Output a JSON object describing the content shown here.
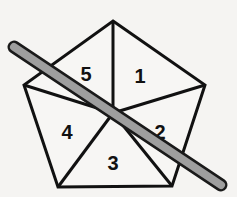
{
  "figure": {
    "name": "pentagon-with-stick",
    "background_color": "#f5f4f2",
    "canvas": {
      "width": 237,
      "height": 197
    },
    "pentagon": {
      "stroke_color": "#111111",
      "fill_color": "#f7f6f4",
      "stroke_width": 3,
      "vertices": [
        {
          "name": "top",
          "x": 113,
          "y": 21
        },
        {
          "name": "right",
          "x": 205,
          "y": 85
        },
        {
          "name": "bottom-right",
          "x": 172,
          "y": 186
        },
        {
          "name": "bottom-left",
          "x": 58,
          "y": 187
        },
        {
          "name": "left",
          "x": 24,
          "y": 85
        }
      ],
      "points_attr": "113,21 205,85 172,186 58,187 24,85",
      "center": {
        "x": 113,
        "y": 113
      }
    },
    "spokes": [
      {
        "name": "spoke-to-top",
        "x1": 113,
        "y1": 113,
        "x2": 113,
        "y2": 21
      },
      {
        "name": "spoke-to-right",
        "x1": 113,
        "y1": 113,
        "x2": 205,
        "y2": 85
      },
      {
        "name": "spoke-to-bottom-right",
        "x1": 113,
        "y1": 113,
        "x2": 172,
        "y2": 186
      },
      {
        "name": "spoke-to-bottom-left",
        "x1": 113,
        "y1": 113,
        "x2": 58,
        "y2": 187
      },
      {
        "name": "spoke-to-left",
        "x1": 113,
        "y1": 113,
        "x2": 24,
        "y2": 85
      }
    ],
    "sectors": [
      {
        "id": "sector-1",
        "label": "1",
        "x": 140,
        "y": 78
      },
      {
        "id": "sector-2",
        "label": "2",
        "x": 160,
        "y": 134
      },
      {
        "id": "sector-3",
        "label": "3",
        "x": 113,
        "y": 165
      },
      {
        "id": "sector-4",
        "label": "4",
        "x": 67,
        "y": 134
      },
      {
        "id": "sector-5",
        "label": "5",
        "x": 86,
        "y": 76
      }
    ],
    "stick": {
      "name": "diagonal-stick",
      "fill_color": "#9e9e9e",
      "outline_color": "#1a1a1a",
      "outline_width": 2,
      "thickness": 9,
      "cap": "round",
      "start": {
        "x": 14,
        "y": 47
      },
      "end": {
        "x": 221,
        "y": 185
      }
    }
  }
}
